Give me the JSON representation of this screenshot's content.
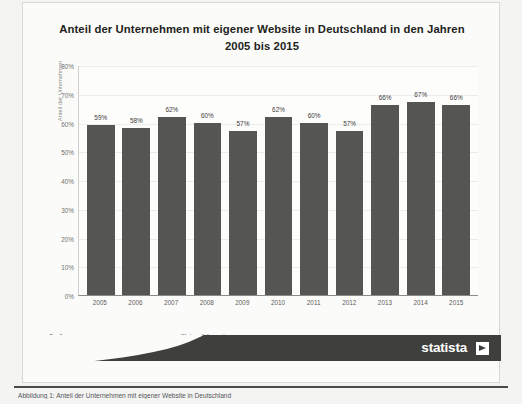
{
  "figure": {
    "title": "Anteil der Unternehmen mit eigener Website in Deutschland in den Jahren 2005 bis 2015"
  },
  "axis": {
    "y_title": "Anteil der Unternehmen"
  },
  "footer": {
    "source_title": "Quelle:",
    "source_line1": "Statistisches Bundesamt",
    "source_line2": "© Statista 2015",
    "info_title": "Weitere Informationen:",
    "info_line1": "Deutschland; Unternehmen mit Internetzugang"
  },
  "brand": {
    "name": "statista"
  },
  "caption": {
    "text": "Abbildung 1: Anteil der Unternehmen mit eigener Website in Deutschland"
  },
  "colors": {
    "bar": "#555553",
    "brand_bar": "#3f3f3d",
    "plot_background": "#fdfdfc",
    "page_background": "#f4f4f2",
    "gridline": "#ececea"
  },
  "chart_data": {
    "type": "bar",
    "title": "Anteil der Unternehmen mit eigener Website in Deutschland in den Jahren 2005 bis 2015",
    "xlabel": "",
    "ylabel": "Anteil der Unternehmen",
    "categories": [
      "2005",
      "2006",
      "2007",
      "2008",
      "2009",
      "2010",
      "2011",
      "2012",
      "2013",
      "2014",
      "2015"
    ],
    "values": [
      59,
      58,
      62,
      60,
      57,
      62,
      60,
      57,
      66,
      67,
      66
    ],
    "value_labels": [
      "59%",
      "58%",
      "62%",
      "60%",
      "57%",
      "62%",
      "60%",
      "57%",
      "66%",
      "67%",
      "66%"
    ],
    "ylim": [
      0,
      80
    ],
    "yticks": [
      0,
      10,
      20,
      30,
      40,
      50,
      60,
      70,
      80
    ],
    "ytick_labels": [
      "0%",
      "10%",
      "20%",
      "30%",
      "40%",
      "50%",
      "60%",
      "70%",
      "80%"
    ],
    "grid": true,
    "legend": "none",
    "units": "percent"
  }
}
